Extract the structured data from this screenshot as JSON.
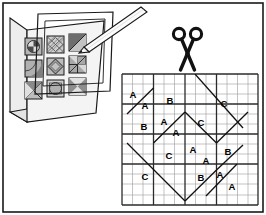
{
  "illustration": {
    "title": "Quilt block pattern book with cutting grid",
    "line_color": "#1a1a1a",
    "background_color": "#ffffff",
    "border": {
      "name": "outer-frame",
      "stroke": "#1a1a1a"
    }
  },
  "pattern_book": {
    "label": "pattern-book",
    "cover_fill": "#f2f2f2",
    "spine_fill": "#e8e8e8",
    "page_fill": "#f7f7f7",
    "blocks": [
      {
        "id": "block-1",
        "pattern": "pie-circle",
        "fill": "#b5b5b5"
      },
      {
        "id": "block-2",
        "pattern": "crosshatch-diamond",
        "fill": "#c9c9c9"
      },
      {
        "id": "block-3",
        "pattern": "diagonal-split",
        "fill": "#8f8f8f"
      },
      {
        "id": "block-4",
        "pattern": "quarter-fan",
        "fill": "#b0b0b0"
      },
      {
        "id": "block-5",
        "pattern": "diamond-in-square",
        "fill": "#bdbdbd"
      },
      {
        "id": "block-6",
        "pattern": "four-patch-quarters",
        "fill": "#a8a8a8"
      },
      {
        "id": "block-7",
        "pattern": "x-star",
        "fill": "#bcbcbc"
      },
      {
        "id": "block-8",
        "pattern": "circle-in-square",
        "fill": "#cccccc"
      },
      {
        "id": "block-9",
        "pattern": "hourglass-zigzag",
        "fill": "#b2b2b2"
      }
    ]
  },
  "overlay_template": {
    "label": "transparent-template-sheet",
    "stroke": "#1a1a1a"
  },
  "pencil": {
    "label": "pencil-pointer",
    "body_fill": "#fafafa",
    "stroke": "#1a1a1a"
  },
  "scissors": {
    "label": "scissors",
    "fill": "#111111"
  },
  "cutting_grid": {
    "label": "cutting-grid",
    "minor_stroke": "#9a9a9a",
    "major_stroke": "#2b2b2b",
    "columns": 13,
    "rows": 13,
    "major_every": 3,
    "piece_labels": [
      {
        "text": "A",
        "x": 133,
        "y": 98
      },
      {
        "text": "A",
        "x": 145,
        "y": 109
      },
      {
        "text": "B",
        "x": 170,
        "y": 104
      },
      {
        "text": "C",
        "x": 224,
        "y": 107
      },
      {
        "text": "B",
        "x": 144,
        "y": 130
      },
      {
        "text": "A",
        "x": 164,
        "y": 125
      },
      {
        "text": "A",
        "x": 176,
        "y": 136
      },
      {
        "text": "C",
        "x": 201,
        "y": 126
      },
      {
        "text": "C",
        "x": 169,
        "y": 159
      },
      {
        "text": "A",
        "x": 193,
        "y": 153
      },
      {
        "text": "A",
        "x": 206,
        "y": 164
      },
      {
        "text": "B",
        "x": 228,
        "y": 155
      },
      {
        "text": "C",
        "x": 145,
        "y": 180
      },
      {
        "text": "B",
        "x": 201,
        "y": 181
      },
      {
        "text": "A",
        "x": 220,
        "y": 178
      },
      {
        "text": "A",
        "x": 232,
        "y": 190
      }
    ]
  }
}
